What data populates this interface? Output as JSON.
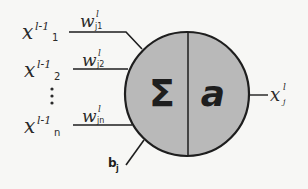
{
  "diagram": {
    "type": "artificial-neuron",
    "colors": {
      "background": "#f7f7f5",
      "neuron_fill": "#b9b9b9",
      "stroke": "#1e1e1e",
      "text": "#2a2a2a"
    },
    "inputs": [
      {
        "symbol": "x",
        "superscript": "l-1",
        "subscript": "1",
        "weight_symbol": "w",
        "weight_superscript": "l",
        "weight_subscript": "j1"
      },
      {
        "symbol": "x",
        "superscript": "l-1",
        "subscript": "2",
        "weight_symbol": "w",
        "weight_superscript": "l",
        "weight_subscript": "j2"
      },
      {
        "symbol": "x",
        "superscript": "l-1",
        "subscript": "n",
        "weight_symbol": "w",
        "weight_superscript": "l",
        "weight_subscript": "jn"
      }
    ],
    "ellipsis": "⋮",
    "neuron": {
      "sum_symbol": "Σ",
      "activation_symbol": "a"
    },
    "bias": {
      "symbol": "b",
      "subscript": "j"
    },
    "output": {
      "symbol": "x",
      "superscript": "l",
      "subscript": "j"
    }
  }
}
